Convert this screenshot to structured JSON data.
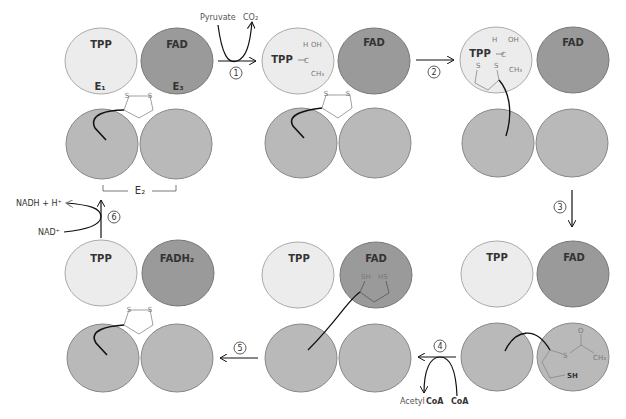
{
  "figure": {
    "type": "pyruvate dehydrogenase complex reaction cycle",
    "colors": {
      "e1_fill": "#ececec",
      "e3_fill": "#9a9a9a",
      "e2_fill": "#b9b9b9",
      "stroke": "#888888",
      "arrow": "#111111"
    }
  },
  "panels": [
    {
      "id": 1,
      "e1_label": "TPP",
      "e3_label": "FAD",
      "e1_sub": "E₁",
      "e3_sub": "E₃",
      "e2_label": "E₂",
      "lipoamide": "S—S"
    },
    {
      "id": 2,
      "e1_label": "TPP",
      "e3_label": "FAD",
      "adduct": {
        "h": "H",
        "oh": "OH",
        "c": "C",
        "ch3": "CH₃"
      }
    },
    {
      "id": 3,
      "e1_label": "TPP",
      "e3_label": "FAD",
      "adduct": {
        "h": "H",
        "oh": "OH",
        "c": "C",
        "ch3": "CH₃",
        "s1": "S",
        "s2": "S"
      }
    },
    {
      "id": 4,
      "e1_label": "TPP",
      "e3_label": "FAD",
      "acetyl": {
        "o": "O",
        "s": "S",
        "ch3": "CH₃",
        "sh": "SH"
      }
    },
    {
      "id": 5,
      "e1_label": "TPP",
      "e3_label": "FAD",
      "reduced": {
        "sh": "SH",
        "hs": "HS"
      }
    },
    {
      "id": 6,
      "e1_label": "TPP",
      "e3_label": "FADH₂",
      "lipoamide": "S—S"
    }
  ],
  "steps": [
    {
      "n": "1",
      "inputs": "Pyruvate",
      "outputs": "CO₂"
    },
    {
      "n": "2"
    },
    {
      "n": "3"
    },
    {
      "n": "4",
      "inputs": "CoA",
      "outputs": "Acetyl",
      "outputs_b": "CoA"
    },
    {
      "n": "5"
    },
    {
      "n": "6",
      "inputs": "NAD⁺",
      "outputs": "NADH + H⁺"
    }
  ]
}
